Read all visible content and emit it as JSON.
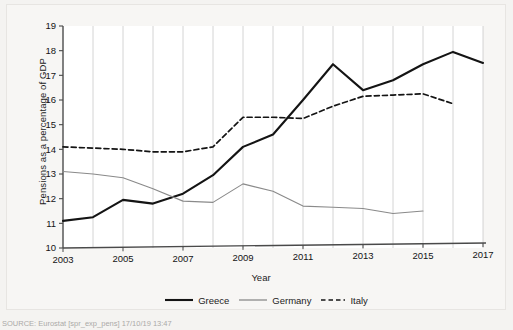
{
  "figure": {
    "source_note": "SOURCE: Eurostat [spr_exp_pens] 17/10/19 13:47",
    "xlabel": "Year",
    "ylabel": "Pensions as a percentage of GDP"
  },
  "colors": {
    "greece": "#141414",
    "germany": "#8a8a8a",
    "italy": "#141414",
    "axis": "#4a4a4a",
    "grid": "#c9c9c9",
    "plot_background": "#ffffff",
    "page_background": "#f4f3f1"
  },
  "legend": {
    "position": "bottom",
    "items": [
      {
        "label": "Greece",
        "style": "solid-thick",
        "color": "#141414"
      },
      {
        "label": "Germany",
        "style": "solid-thin",
        "color": "#8a8a8a"
      },
      {
        "label": "Italy",
        "style": "dashed",
        "color": "#141414"
      }
    ]
  },
  "chart_data": {
    "type": "line",
    "title": "",
    "subtitle": "",
    "xlabel": "Year",
    "ylabel": "Pensions as a percentage of GDP",
    "xlim": [
      2003,
      2017
    ],
    "ylim": [
      10,
      19
    ],
    "yticks": [
      10,
      11,
      12,
      13,
      14,
      15,
      16,
      17,
      18,
      19
    ],
    "ytick_labels": [
      "10",
      "11",
      "12",
      "13",
      "14",
      "15",
      "16",
      "17",
      "18",
      "19"
    ],
    "xticks": [
      2003,
      2005,
      2007,
      2009,
      2011,
      2013,
      2015,
      2017
    ],
    "xtick_labels": [
      "2003",
      "2005",
      "2007",
      "2009",
      "2011",
      "2013",
      "2015",
      "2017"
    ],
    "grid": "vertical-only-at-every-year",
    "x": [
      2003,
      2004,
      2005,
      2006,
      2007,
      2008,
      2009,
      2010,
      2011,
      2012,
      2013,
      2014,
      2015,
      2016,
      2017
    ],
    "series": [
      {
        "name": "Greece",
        "style": "solid-thick",
        "color": "#141414",
        "values": [
          11.1,
          11.25,
          11.95,
          11.8,
          12.2,
          12.95,
          14.1,
          14.6,
          16.0,
          17.45,
          16.4,
          16.8,
          17.45,
          17.95,
          17.5
        ]
      },
      {
        "name": "Germany",
        "style": "solid-thin",
        "color": "#8a8a8a",
        "values": [
          13.1,
          13.0,
          12.85,
          12.4,
          11.9,
          11.85,
          12.6,
          12.3,
          11.7,
          11.65,
          11.6,
          11.4,
          11.5,
          null,
          null
        ]
      },
      {
        "name": "Italy",
        "style": "dashed",
        "color": "#141414",
        "values": [
          14.1,
          14.05,
          14.0,
          13.9,
          13.9,
          14.1,
          15.3,
          15.3,
          15.25,
          15.75,
          16.15,
          16.2,
          16.25,
          15.85,
          null
        ]
      }
    ]
  }
}
